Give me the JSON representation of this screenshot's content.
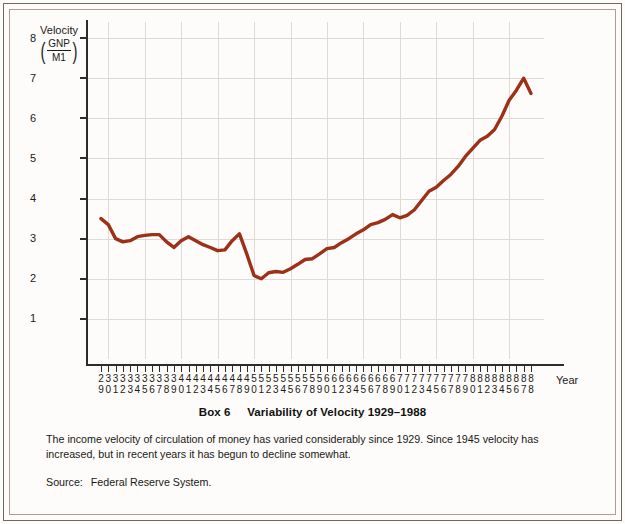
{
  "figure": {
    "box_label": "Box 6",
    "title": "Variability of Velocity 1929–1988",
    "caption": "The income velocity of circulation of money has varied considerably since 1929. Since 1945 velocity has increased, but in recent years it has begun to decline somewhat.",
    "source_label": "Source:",
    "source_value": "Federal Reserve System."
  },
  "axis": {
    "y_title_main": "Velocity",
    "y_numerator": "GNP",
    "y_denominator": "M1",
    "x_title": "Year",
    "paren_open": "(",
    "paren_close": ")"
  },
  "colors": {
    "line": "#9c3118",
    "axis": "#2e2b28",
    "grid": "#dedad6",
    "frame_outer": "#6d6a66",
    "frame_inner": "#b49a92",
    "background": "#fdfcfa",
    "text": "#1c1a18"
  },
  "chart_data": {
    "type": "line",
    "title": "Variability of Velocity 1929–1988",
    "xlabel": "Year",
    "ylabel": "Velocity (GNP/M1)",
    "xlim": [
      1929,
      1988
    ],
    "ylim": [
      0,
      8.4
    ],
    "yticks": [
      1,
      2,
      3,
      4,
      5,
      6,
      7,
      8
    ],
    "ytick_labels": [
      "1",
      "2",
      "3",
      "4",
      "5",
      "6",
      "7",
      "8"
    ],
    "xtick_labels": [
      "29",
      "30",
      "31",
      "32",
      "33",
      "34",
      "35",
      "36",
      "37",
      "38",
      "39",
      "40",
      "41",
      "42",
      "43",
      "44",
      "45",
      "46",
      "47",
      "48",
      "49",
      "50",
      "51",
      "52",
      "53",
      "54",
      "55",
      "56",
      "57",
      "58",
      "59",
      "60",
      "61",
      "62",
      "63",
      "64",
      "65",
      "66",
      "67",
      "68",
      "69",
      "70",
      "71",
      "72",
      "73",
      "74",
      "75",
      "76",
      "77",
      "78",
      "79",
      "80",
      "81",
      "82",
      "83",
      "84",
      "85",
      "86",
      "87",
      "88"
    ],
    "grid": true,
    "grid_x_every": 5,
    "legend": "none",
    "series": [
      {
        "name": "Velocity (GNP/M1)",
        "x": [
          1929,
          1930,
          1931,
          1932,
          1933,
          1934,
          1935,
          1936,
          1937,
          1938,
          1939,
          1940,
          1941,
          1942,
          1943,
          1944,
          1945,
          1946,
          1947,
          1948,
          1949,
          1950,
          1951,
          1952,
          1953,
          1954,
          1955,
          1956,
          1957,
          1958,
          1959,
          1960,
          1961,
          1962,
          1963,
          1964,
          1965,
          1966,
          1967,
          1968,
          1969,
          1970,
          1971,
          1972,
          1973,
          1974,
          1975,
          1976,
          1977,
          1978,
          1979,
          1980,
          1981,
          1982,
          1983,
          1984,
          1985,
          1986,
          1987,
          1988
        ],
        "values": [
          3.5,
          3.35,
          3.0,
          2.92,
          2.95,
          3.05,
          3.08,
          3.1,
          3.1,
          2.92,
          2.78,
          2.95,
          3.05,
          2.95,
          2.85,
          2.78,
          2.7,
          2.72,
          2.95,
          3.12,
          2.62,
          2.08,
          2.0,
          2.15,
          2.18,
          2.16,
          2.25,
          2.36,
          2.48,
          2.5,
          2.62,
          2.75,
          2.78,
          2.9,
          3.0,
          3.12,
          3.22,
          3.35,
          3.4,
          3.48,
          3.6,
          3.52,
          3.58,
          3.72,
          3.95,
          4.18,
          4.28,
          4.45,
          4.6,
          4.8,
          5.05,
          5.25,
          5.45,
          5.55,
          5.72,
          6.05,
          6.45,
          6.7,
          7.0,
          6.62
        ]
      }
    ],
    "annotations": {
      "start_value": 3.5,
      "trough_value": 2.0,
      "trough_year": 1946,
      "peak_value": 7.2,
      "peak_year": 1981,
      "end_value": 5.95
    }
  }
}
